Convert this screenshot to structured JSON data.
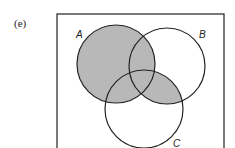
{
  "figure": {
    "panel_label": "(e)",
    "sets": [
      {
        "name": "A",
        "cx": 116,
        "cy": 64,
        "r": 39,
        "label_x": 76,
        "label_y": 38
      },
      {
        "name": "B",
        "cx": 167,
        "cy": 66,
        "r": 38,
        "label_x": 199,
        "label_y": 38
      },
      {
        "name": "C",
        "cx": 144,
        "cy": 109,
        "r": 39,
        "label_x": 175,
        "label_y": 148
      }
    ],
    "shaded_region": "A ∪ (B ∩ C)",
    "shade_color": "#b8b8b8",
    "stroke_color": "#222222",
    "universe": {
      "x": 57,
      "y": 14,
      "width": 167,
      "height": 140
    }
  }
}
